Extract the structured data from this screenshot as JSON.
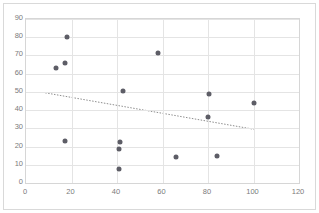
{
  "chart_data": {
    "type": "scatter",
    "title": "",
    "xlabel": "",
    "ylabel": "",
    "xlim": [
      0,
      120
    ],
    "ylim": [
      0,
      90
    ],
    "grid": true,
    "legend": false,
    "xticks": [
      0,
      20,
      40,
      60,
      80,
      100,
      120
    ],
    "yticks": [
      0,
      10,
      20,
      30,
      40,
      50,
      60,
      70,
      80,
      90
    ],
    "series": [
      {
        "name": "data",
        "marker": "circle",
        "color": "#5d5d66",
        "points": [
          {
            "x": 13,
            "y": 63
          },
          {
            "x": 17,
            "y": 66
          },
          {
            "x": 18,
            "y": 80
          },
          {
            "x": 17,
            "y": 23
          },
          {
            "x": 41,
            "y": 7.5
          },
          {
            "x": 41,
            "y": 18.5
          },
          {
            "x": 41.5,
            "y": 22.5
          },
          {
            "x": 42.5,
            "y": 50.5
          },
          {
            "x": 58,
            "y": 71.5
          },
          {
            "x": 66,
            "y": 14
          },
          {
            "x": 80.5,
            "y": 49
          },
          {
            "x": 80,
            "y": 36
          },
          {
            "x": 84,
            "y": 15
          },
          {
            "x": 100,
            "y": 44
          }
        ]
      }
    ],
    "trendline": {
      "style": "dotted",
      "color": "#8c8c8c",
      "x_start": 8.5,
      "y_start": 49,
      "x_end": 102,
      "y_end": 28.5
    }
  }
}
